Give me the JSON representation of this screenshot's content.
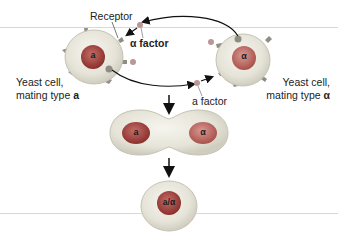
{
  "diagram": {
    "labels": {
      "receptor": "Receptor",
      "alpha_factor": "α factor",
      "a_factor": "a factor",
      "cell_a_line1": "Yeast cell,",
      "cell_a_line2": "mating type ",
      "cell_a_type": "a",
      "cell_alpha_line1": "Yeast cell,",
      "cell_alpha_line2": "mating type ",
      "cell_alpha_type": "α"
    },
    "nuclei": {
      "cell_a": "a",
      "cell_alpha": "α",
      "fused_left": "a",
      "fused_right": "α",
      "diploid": "a/α"
    },
    "colors": {
      "cell_fill": "#e8e6dc",
      "cell_edge": "#c9c6b8",
      "nucleus_a": "#9a3c3a",
      "nucleus_alpha": "#b35a56",
      "receptor": "#8a8a80",
      "factor": "#a07070",
      "arrow": "#111111"
    }
  }
}
